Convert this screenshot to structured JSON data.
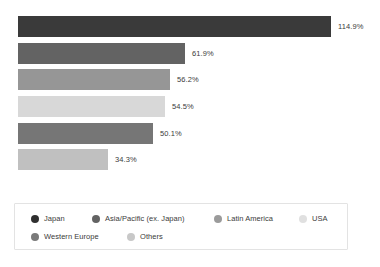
{
  "chart_data": {
    "type": "bar",
    "orientation": "horizontal",
    "title": "",
    "subtitle": "",
    "xlabel": "",
    "ylabel": "",
    "grid": false,
    "axis_visible": false,
    "xlim": [
      0,
      114.9
    ],
    "legend_position": "bottom",
    "categories": [
      "Japan",
      "Asia/Pacific (ex. Japan)",
      "Latin America",
      "USA",
      "Western Europe",
      "Others"
    ],
    "values": [
      114.9,
      61.9,
      56.2,
      54.5,
      50.1,
      34.3
    ],
    "value_labels": [
      "114.9%",
      "61.9%",
      "56.2%",
      "54.5%",
      "50.1%",
      "34.3%"
    ],
    "colors": [
      "#3a3a3a",
      "#636363",
      "#969696",
      "#d8d8d8",
      "#767676",
      "#c0c0c0"
    ],
    "bars": [
      {
        "label": "Japan",
        "value": 114.9,
        "value_label": "114.9%",
        "color": "#3a3a3a",
        "width_px": 313,
        "top_px": 16
      },
      {
        "label": "Asia/Pacific (ex. Japan)",
        "value": 61.9,
        "value_label": "61.9%",
        "color": "#636363",
        "width_px": 167,
        "top_px": 43
      },
      {
        "label": "Latin America",
        "value": 56.2,
        "value_label": "56.2%",
        "color": "#969696",
        "width_px": 152,
        "top_px": 69
      },
      {
        "label": "USA",
        "value": 54.5,
        "value_label": "54.5%",
        "color": "#d8d8d8",
        "width_px": 147,
        "top_px": 96
      },
      {
        "label": "Western Europe",
        "value": 50.1,
        "value_label": "50.1%",
        "color": "#767676",
        "width_px": 135,
        "top_px": 123
      },
      {
        "label": "Others",
        "value": 34.3,
        "value_label": "34.3%",
        "color": "#c0c0c0",
        "width_px": 90,
        "top_px": 149
      }
    ]
  },
  "legend": {
    "rows": [
      [
        {
          "label": "Japan",
          "color": "#2f2f2f",
          "left_px": 16
        },
        {
          "label": "Asia/Pacific (ex. Japan)",
          "color": "#636363",
          "left_px": 77
        },
        {
          "label": "Latin America",
          "color": "#9b9b9b",
          "left_px": 199
        },
        {
          "label": "USA",
          "color": "#e0e0e0",
          "left_px": 284
        }
      ],
      [
        {
          "label": "Western Europe",
          "color": "#7a7a7a",
          "left_px": 16
        },
        {
          "label": "Others",
          "color": "#c8c8c8",
          "left_px": 112
        }
      ]
    ]
  },
  "theme": {
    "background": "#ffffff",
    "text_color": "#3b3b3b",
    "legend_border": "#e3e3e3"
  }
}
